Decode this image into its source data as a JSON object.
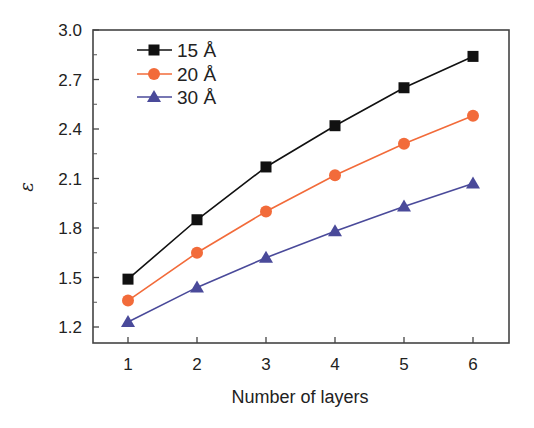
{
  "chart_data": {
    "type": "line",
    "title": "",
    "xlabel": "Number of layers",
    "ylabel": "ε",
    "x": [
      1,
      2,
      3,
      4,
      5,
      6
    ],
    "xticks": [
      "1",
      "2",
      "3",
      "4",
      "5",
      "6"
    ],
    "yticks": [
      "1.2",
      "1.5",
      "1.8",
      "2.1",
      "2.4",
      "2.7",
      "3.0"
    ],
    "ylim": [
      1.1,
      3.0
    ],
    "xlim": [
      0.5,
      6.5
    ],
    "grid": false,
    "legend_position": "upper left",
    "series": [
      {
        "name": "15 Å",
        "marker": "square",
        "color": "#111111",
        "values": [
          1.49,
          1.85,
          2.17,
          2.42,
          2.65,
          2.84
        ]
      },
      {
        "name": "20 Å",
        "marker": "circle",
        "color": "#f26b3a",
        "values": [
          1.36,
          1.65,
          1.9,
          2.12,
          2.31,
          2.48
        ]
      },
      {
        "name": "30 Å",
        "marker": "triangle",
        "color": "#4a4a9a",
        "values": [
          1.23,
          1.44,
          1.62,
          1.78,
          1.93,
          2.07
        ]
      }
    ]
  }
}
